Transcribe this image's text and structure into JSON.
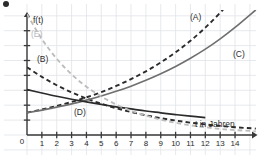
{
  "figure": {
    "bullet_marker": "•",
    "background": "#ffffff",
    "grid_color": "#dfe3e8",
    "axis_color": "#3a3a3a"
  },
  "axis_labels": {
    "y_axis": "f(t)",
    "x_axis": "t in Jahren",
    "origin": "0"
  },
  "curve_labels": [
    {
      "id": "A",
      "text": "(A)",
      "x": 190,
      "y": 13,
      "color": "#2b2b2b"
    },
    {
      "id": "B",
      "text": "(B)",
      "x": 37,
      "y": 55,
      "color": "#2b2b2b"
    },
    {
      "id": "C",
      "text": "(C)",
      "x": 233,
      "y": 50,
      "color": "#2b2b2b"
    },
    {
      "id": "D",
      "text": "(D)",
      "x": 74,
      "y": 108,
      "color": "#2b2b2b"
    },
    {
      "id": "E",
      "text": "(E)",
      "x": 31,
      "y": 30,
      "color": "#b9b9b9"
    }
  ],
  "chart_data": {
    "type": "line",
    "title": "",
    "xlabel": "t in Jahren",
    "ylabel": "f(t)",
    "xlim": [
      0,
      15.5
    ],
    "ylim": [
      0,
      8.2
    ],
    "grid": true,
    "legend": "inline-curve-labels",
    "xticks": [
      0,
      1,
      2,
      3,
      4,
      5,
      6,
      7,
      8,
      9,
      10,
      11,
      12,
      13,
      14
    ],
    "xticklabels": [
      "0",
      "1",
      "2",
      "3",
      "4",
      "5",
      "6",
      "7",
      "8",
      "9",
      "10",
      "11",
      "12",
      "13",
      "14"
    ],
    "yticks": [
      0,
      1,
      2,
      3,
      4,
      5,
      6,
      7,
      8
    ],
    "yticklabels": [
      "",
      "",
      "",
      "",
      "",
      "",
      "",
      "",
      ""
    ],
    "series": [
      {
        "name": "(A)",
        "style": "dashed",
        "color": "#2b2b2b",
        "width": 1.9,
        "x": [
          0,
          1,
          2,
          3,
          4,
          5,
          6,
          7,
          8,
          9,
          10,
          11,
          12,
          13,
          14,
          15.4
        ],
        "y": [
          1.5,
          1.71,
          1.95,
          2.22,
          2.53,
          2.88,
          3.29,
          3.75,
          4.27,
          4.87,
          5.55,
          6.32,
          7.21,
          8.21,
          9.36,
          11.2
        ]
      },
      {
        "name": "(B)",
        "style": "dashed",
        "color": "#2b2b2b",
        "width": 1.9,
        "x": [
          0,
          1,
          2,
          3,
          4,
          5,
          6,
          7,
          8,
          9,
          10,
          11,
          12,
          13,
          14,
          15.4
        ],
        "y": [
          4.55,
          3.9,
          3.34,
          2.86,
          2.45,
          2.1,
          1.8,
          1.54,
          1.32,
          1.13,
          0.97,
          0.83,
          0.71,
          0.61,
          0.52,
          0.43
        ]
      },
      {
        "name": "(C)",
        "style": "solid",
        "color": "#6f6f6f",
        "width": 1.6,
        "x": [
          0,
          1,
          2,
          3,
          4,
          5,
          6,
          7,
          8,
          9,
          10,
          11,
          12,
          13,
          14,
          15.4
        ],
        "y": [
          1.5,
          1.67,
          1.87,
          2.09,
          2.34,
          2.62,
          2.93,
          3.28,
          3.67,
          4.11,
          4.6,
          5.15,
          5.76,
          6.45,
          7.22,
          8.4
        ]
      },
      {
        "name": "(D)",
        "style": "solid",
        "color": "#2b2b2b",
        "width": 1.7,
        "x": [
          0,
          1,
          2,
          3,
          4,
          5,
          6,
          7,
          8,
          9,
          10,
          11,
          12
        ],
        "y": [
          3.05,
          2.82,
          2.6,
          2.4,
          2.22,
          2.05,
          1.89,
          1.75,
          1.61,
          1.49,
          1.37,
          1.27,
          1.17
        ]
      },
      {
        "name": "(E)",
        "style": "dashed",
        "color": "#bcbcbc",
        "width": 1.8,
        "x": [
          0,
          1,
          2,
          3,
          4,
          5,
          6,
          7,
          8,
          9,
          10,
          11,
          12,
          13,
          14,
          15.4
        ],
        "y": [
          8.1,
          6.44,
          5.12,
          4.07,
          3.24,
          2.58,
          2.05,
          1.63,
          1.3,
          1.03,
          0.82,
          0.65,
          0.52,
          0.41,
          0.33,
          0.25
        ]
      }
    ]
  }
}
